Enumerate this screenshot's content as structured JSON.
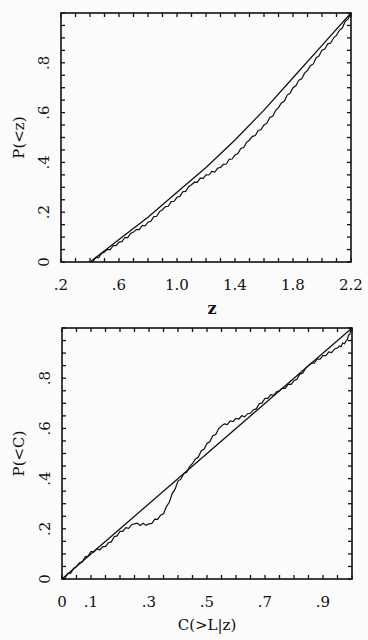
{
  "chart_data": [
    {
      "type": "line",
      "title": "",
      "xlabel": "z",
      "ylabel": "P(<z)",
      "xlim": [
        0.2,
        2.2
      ],
      "ylim": [
        0,
        1.0
      ],
      "x_tick_labels": [
        ".2",
        ".6",
        "1.0",
        "1.4",
        "1.8",
        "2.2"
      ],
      "x_ticks": [
        0.2,
        0.6,
        1.0,
        1.4,
        1.8,
        2.2
      ],
      "y_tick_labels": [
        "0",
        ".2",
        ".4",
        ".6",
        ".8"
      ],
      "y_ticks": [
        0,
        0.2,
        0.4,
        0.6,
        0.8
      ],
      "grid": false,
      "legend": null,
      "series": [
        {
          "name": "model (smooth)",
          "x": [
            0.4,
            0.6,
            0.8,
            1.0,
            1.2,
            1.4,
            1.6,
            1.8,
            2.0,
            2.2
          ],
          "values": [
            0.0,
            0.09,
            0.18,
            0.28,
            0.38,
            0.49,
            0.61,
            0.74,
            0.87,
            1.0
          ]
        },
        {
          "name": "observed (step)",
          "x": [
            0.4,
            0.5,
            0.6,
            0.7,
            0.8,
            0.9,
            1.0,
            1.1,
            1.2,
            1.3,
            1.4,
            1.5,
            1.6,
            1.7,
            1.8,
            1.9,
            2.0,
            2.1,
            2.2
          ],
          "values": [
            0.0,
            0.04,
            0.08,
            0.12,
            0.16,
            0.21,
            0.26,
            0.31,
            0.35,
            0.38,
            0.43,
            0.49,
            0.55,
            0.62,
            0.7,
            0.77,
            0.85,
            0.91,
            1.0
          ]
        }
      ]
    },
    {
      "type": "line",
      "title": "",
      "xlabel": "C(>L|z)",
      "ylabel": "P(<C)",
      "xlim": [
        0,
        1.0
      ],
      "ylim": [
        0,
        1.0
      ],
      "x_tick_labels": [
        "0",
        ".1",
        ".3",
        ".5",
        ".7",
        ".9"
      ],
      "x_ticks": [
        0,
        0.1,
        0.3,
        0.5,
        0.7,
        0.9
      ],
      "y_tick_labels": [
        "0",
        ".2",
        ".4",
        ".6",
        ".8"
      ],
      "y_ticks": [
        0,
        0.2,
        0.4,
        0.6,
        0.8
      ],
      "grid": false,
      "legend": null,
      "series": [
        {
          "name": "uniform (diagonal)",
          "x": [
            0,
            1.0
          ],
          "values": [
            0,
            1.0
          ]
        },
        {
          "name": "observed (step)",
          "x": [
            0.0,
            0.05,
            0.1,
            0.15,
            0.2,
            0.25,
            0.3,
            0.35,
            0.4,
            0.45,
            0.5,
            0.55,
            0.6,
            0.65,
            0.7,
            0.75,
            0.8,
            0.85,
            0.9,
            0.95,
            0.98,
            1.0
          ],
          "values": [
            0.0,
            0.05,
            0.11,
            0.13,
            0.19,
            0.22,
            0.22,
            0.26,
            0.39,
            0.46,
            0.54,
            0.61,
            0.64,
            0.66,
            0.72,
            0.75,
            0.79,
            0.85,
            0.89,
            0.92,
            0.95,
            1.0
          ]
        }
      ]
    }
  ],
  "colors": {
    "line": "#111111",
    "background": "#fbfbfb"
  }
}
